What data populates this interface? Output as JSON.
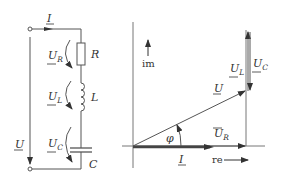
{
  "circuit": {
    "current_label": "I",
    "source_voltage_label": "U",
    "components": [
      {
        "id": "R",
        "label": "R",
        "voltage_label": "U",
        "voltage_sub": "R"
      },
      {
        "id": "L",
        "label": "L",
        "voltage_label": "U",
        "voltage_sub": "L"
      },
      {
        "id": "C",
        "label": "C",
        "voltage_label": "U",
        "voltage_sub": "C"
      }
    ]
  },
  "phasor": {
    "im_axis_label": "im",
    "re_axis_label": "re",
    "angle_label": "φ",
    "vectors": {
      "U": {
        "label": "U",
        "sub": ""
      },
      "UR": {
        "label": "U",
        "sub": "R"
      },
      "UL": {
        "label": "U",
        "sub": "L"
      },
      "UC": {
        "label": "U",
        "sub": "C"
      },
      "I": {
        "label": "I",
        "sub": ""
      }
    }
  }
}
